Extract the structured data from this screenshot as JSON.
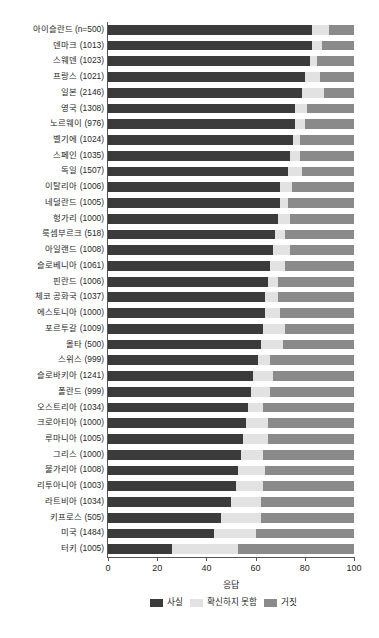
{
  "chart_data": {
    "type": "bar",
    "orientation": "horizontal",
    "stacked": true,
    "stack_mode": "percent",
    "title": "",
    "xlabel": "응답",
    "ylabel": "",
    "xlim": [
      0,
      100
    ],
    "xticks": [
      0,
      20,
      40,
      60,
      80,
      100
    ],
    "grid": false,
    "legend_position": "bottom",
    "colors": {
      "fact": "#3b3b3b",
      "unsure": "#e2e2e2",
      "false": "#8a8a8a",
      "axis": "#555555",
      "text": "#1f1f1f",
      "background": "#ffffff"
    },
    "series": [
      {
        "name": "사실",
        "key": "fact",
        "color": "#3b3b3b"
      },
      {
        "name": "확신하지 못함",
        "key": "unsure",
        "color": "#e2e2e2"
      },
      {
        "name": "거짓",
        "key": "false",
        "color": "#8a8a8a"
      }
    ],
    "categories": [
      "아이슬란드 (n=500)",
      "덴마크 (1013)",
      "스웨덴 (1023)",
      "프랑스 (1021)",
      "일본 (2146)",
      "영국 (1308)",
      "노르웨이 (976)",
      "벨기에 (1024)",
      "스페인 (1035)",
      "독일 (1507)",
      "이탈리아 (1006)",
      "네덜란드 (1005)",
      "헝가리 (1000)",
      "룩셈부르크 (518)",
      "아일랜드 (1008)",
      "슬로베니아 (1061)",
      "핀란드 (1006)",
      "체코 공화국 (1037)",
      "에스토니아 (1000)",
      "포르투갈 (1009)",
      "몰타 (500)",
      "스위스 (999)",
      "슬로바키아 (1241)",
      "폴란드 (999)",
      "오스트리아 (1034)",
      "크로아티아 (1000)",
      "루마니아 (1005)",
      "그리스 (1000)",
      "불가리아 (1008)",
      "리투아니아 (1003)",
      "라트비아 (1034)",
      "키프로스 (505)",
      "미국 (1484)",
      "터키 (1005)"
    ],
    "values": {
      "fact": [
        83,
        83,
        82,
        80,
        79,
        76,
        76,
        75,
        74,
        73,
        70,
        70,
        69,
        68,
        67,
        66,
        65,
        64,
        64,
        63,
        62,
        61,
        59,
        58,
        57,
        56,
        55,
        54,
        53,
        52,
        50,
        46,
        43,
        26
      ],
      "unsure": [
        7,
        4,
        3,
        6,
        9,
        5,
        4,
        3,
        4,
        6,
        5,
        3,
        5,
        4,
        7,
        6,
        4,
        5,
        6,
        9,
        9,
        5,
        8,
        8,
        6,
        9,
        10,
        9,
        11,
        11,
        12,
        16,
        17,
        27
      ],
      "false": [
        10,
        13,
        15,
        14,
        12,
        19,
        20,
        22,
        22,
        21,
        25,
        27,
        26,
        28,
        26,
        28,
        31,
        31,
        30,
        28,
        29,
        34,
        33,
        34,
        37,
        35,
        35,
        37,
        36,
        37,
        38,
        38,
        40,
        47
      ]
    }
  }
}
